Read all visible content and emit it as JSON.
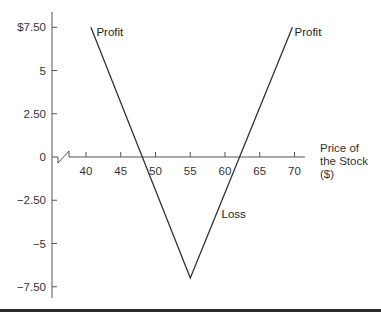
{
  "chart_data": {
    "type": "line",
    "title": "",
    "xlabel": "Price of the Stock ($)",
    "xlabel_lines": [
      "Price of",
      "the Stock",
      "($)"
    ],
    "ylabel": "",
    "x_ticks": [
      40,
      45,
      50,
      55,
      60,
      65,
      70
    ],
    "x_tick_labels": [
      "40",
      "45",
      "50",
      "55",
      "60",
      "65",
      "70"
    ],
    "y_ticks": [
      7.5,
      5,
      2.5,
      0,
      -2.5,
      -5,
      -7.5
    ],
    "y_tick_labels": [
      "$7.50",
      "5",
      "2.50",
      "0",
      "−2.50",
      "−5",
      "−7.50"
    ],
    "xlim": [
      35,
      72
    ],
    "ylim": [
      -8,
      8.3
    ],
    "axis_break": true,
    "grid": false,
    "series": [
      {
        "name": "Payoff",
        "x": [
          40.7,
          55,
          69.7
        ],
        "y": [
          7.5,
          -7.0,
          7.5
        ]
      }
    ],
    "annotations": [
      {
        "text": "Profit",
        "x": 41.5,
        "y": 7.2
      },
      {
        "text": "Profit",
        "x": 70.0,
        "y": 7.2
      },
      {
        "text": "Loss",
        "x": 59.5,
        "y": -3.3
      }
    ]
  }
}
